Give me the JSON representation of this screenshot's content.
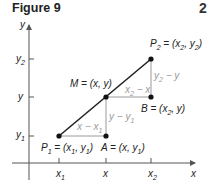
{
  "figure": {
    "title": "Figure 9",
    "corner_mark": "2"
  },
  "axes": {
    "x_label": "x",
    "y_label": "y",
    "x_ticks": [
      {
        "base": "x",
        "sub": "1"
      },
      {
        "base": "x",
        "sub": ""
      },
      {
        "base": "x",
        "sub": "2"
      }
    ],
    "y_ticks": [
      {
        "base": "y",
        "sub": "2"
      },
      {
        "base": "y",
        "sub": ""
      },
      {
        "base": "y",
        "sub": "1"
      }
    ]
  },
  "points": {
    "P1": {
      "name": "P",
      "name_sub": "1",
      "coords": "(x1, y1)"
    },
    "P2": {
      "name": "P",
      "name_sub": "2",
      "coords": "(x2, y2)"
    },
    "M": {
      "name": "M",
      "coords": "(x, y)"
    },
    "A": {
      "name": "A",
      "coords": "(x, y1)"
    },
    "B": {
      "name": "B",
      "coords": "(x2, y)"
    }
  },
  "segment_labels": {
    "x_minus_x1": "x − x1",
    "y_minus_y1": "y − y1",
    "x2_minus_x": "x2 − x",
    "y2_minus_y": "y2 − y"
  },
  "colors": {
    "axis": "#555555",
    "line": "#222222",
    "helper_lines": "#9a9a9a",
    "points": "#111111",
    "difference_labels": "#9a9a9a"
  }
}
